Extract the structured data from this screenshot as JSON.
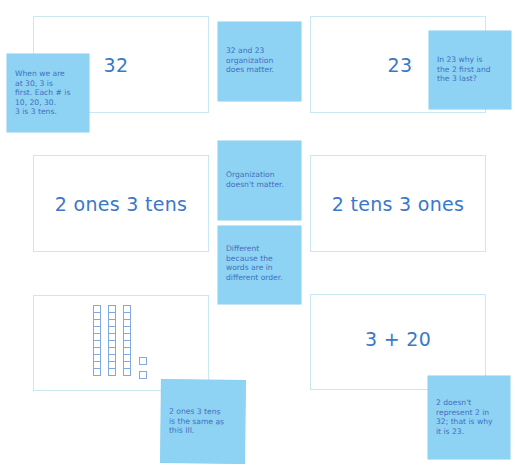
{
  "cards": [
    {
      "id": "card-32",
      "text": "32"
    },
    {
      "id": "card-23",
      "text": "23"
    },
    {
      "id": "card-2-ones-3-tens",
      "text": "2 ones 3 tens"
    },
    {
      "id": "card-2-tens-3-ones",
      "text": "2 tens 3 ones"
    },
    {
      "id": "card-base-ten-blocks",
      "text": "",
      "blocks": {
        "tens_rods": 3,
        "ones_cubes": 2,
        "cubes_per_rod": 10
      }
    },
    {
      "id": "card-3-plus-20",
      "text": "3 + 20"
    }
  ],
  "sticky_notes": [
    {
      "id": "note-when-at-30",
      "text": "When we are\nat 30, 3 is\nfirst. Each # is\n10, 20, 30.\n3 is 3 tens."
    },
    {
      "id": "note-organization-matters",
      "text": "32 and 23\norganization\ndoes matter."
    },
    {
      "id": "note-why-2-first",
      "text": "In 23 why is\nthe 2 first and\nthe 3 last?"
    },
    {
      "id": "note-organization-doesnt-matter",
      "text": "Organization\ndoesn't matter."
    },
    {
      "id": "note-different-order",
      "text": "Different\nbecause the\nwords are in\ndifferent order."
    },
    {
      "id": "note-same-as-this",
      "text": "2 ones 3 tens\nis the same as\nthis III."
    },
    {
      "id": "note-2-doesnt-represent",
      "text": "2 doesn't\nrepresent 2 in\n32; that is why\nit is 23."
    }
  ],
  "colors": {
    "sticky": "#8fd3f4",
    "ink": "#3a78c9",
    "card_border": "#c9e8f2"
  }
}
